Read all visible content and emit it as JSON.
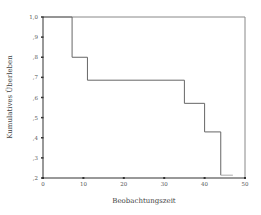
{
  "chart_data": {
    "type": "line",
    "subtype": "kaplan-meier-step",
    "title": "",
    "xlabel": "Beobachtungszeit",
    "ylabel": "Kumulatives Überleben",
    "xlim": [
      0,
      50
    ],
    "ylim": [
      0.2,
      1.0
    ],
    "x_ticks": [
      0,
      10,
      20,
      30,
      40,
      50
    ],
    "x_tick_labels": [
      "0",
      "10",
      "20",
      "30",
      "40",
      "50"
    ],
    "y_ticks": [
      0.2,
      0.3,
      0.4,
      0.5,
      0.6,
      0.7,
      0.8,
      0.9,
      1.0
    ],
    "y_tick_labels": [
      ",2",
      ",3",
      ",4",
      ",5",
      ",6",
      ",7",
      ",8",
      ",9",
      "1,0"
    ],
    "grid": false,
    "legend": null,
    "series": [
      {
        "name": "Survival",
        "step": "post",
        "x": [
          0,
          7.2,
          11,
          35,
          40,
          44,
          47
        ],
        "y": [
          1.0,
          0.8,
          0.686,
          0.571,
          0.429,
          0.214,
          0.214
        ],
        "color": "#666666"
      }
    ],
    "frame_color": "#888888",
    "axis_color": "#333333"
  }
}
